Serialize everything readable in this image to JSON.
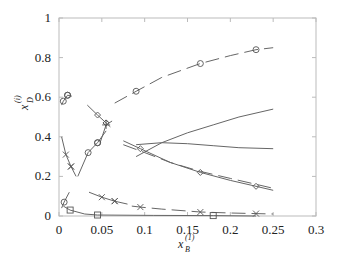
{
  "chart_data": {
    "type": "line",
    "title": "",
    "xlabel": "x_B^(1)",
    "ylabel": "x_D^(i)",
    "xlim": [
      0,
      0.3
    ],
    "ylim": [
      0,
      1
    ],
    "grid": false,
    "legend": null,
    "x_ticks": [
      "0",
      "0.05",
      "0.1",
      "0.15",
      "0.2",
      "0.25",
      "0.3"
    ],
    "y_ticks": [
      "0",
      "0.2",
      "0.4",
      "0.6",
      "0.8",
      "1"
    ],
    "series": [
      {
        "name": "circle-dashed-upper",
        "style": "dashed",
        "marker": "circle",
        "x": [
          0.065,
          0.09,
          0.12,
          0.165,
          0.2,
          0.23,
          0.25
        ],
        "y": [
          0.57,
          0.63,
          0.7,
          0.77,
          0.81,
          0.84,
          0.85
        ]
      },
      {
        "name": "circle-solid-topleft",
        "style": "solid",
        "marker": "circle",
        "x": [
          0.003,
          0.005,
          0.01,
          0.015
        ],
        "y": [
          0.56,
          0.58,
          0.61,
          0.605
        ]
      },
      {
        "name": "diamond-solid-upper",
        "style": "solid",
        "marker": "diamond",
        "x": [
          0.033,
          0.045,
          0.055,
          0.06
        ],
        "y": [
          0.56,
          0.51,
          0.47,
          0.45
        ]
      },
      {
        "name": "plus-descending",
        "style": "solid",
        "marker": "plus",
        "x": [
          0.048,
          0.055,
          0.062
        ],
        "y": [
          0.37,
          0.46,
          0.48
        ]
      },
      {
        "name": "x-solid-left",
        "style": "solid",
        "marker": "x",
        "x": [
          0.003,
          0.008,
          0.014,
          0.02
        ],
        "y": [
          0.4,
          0.31,
          0.25,
          0.2
        ]
      },
      {
        "name": "circle-solid-left-rising",
        "style": "solid",
        "marker": "circle",
        "x": [
          0.022,
          0.034,
          0.045,
          0.055
        ],
        "y": [
          0.2,
          0.32,
          0.37,
          0.43
        ]
      },
      {
        "name": "solid-rising-middle",
        "style": "solid",
        "marker": "none",
        "x": [
          0.09,
          0.12,
          0.15,
          0.18,
          0.21,
          0.25
        ],
        "y": [
          0.3,
          0.37,
          0.42,
          0.46,
          0.5,
          0.54
        ]
      },
      {
        "name": "solid-flat-middle",
        "style": "solid",
        "marker": "none",
        "x": [
          0.09,
          0.12,
          0.15,
          0.18,
          0.21,
          0.25
        ],
        "y": [
          0.36,
          0.37,
          0.365,
          0.355,
          0.345,
          0.34
        ]
      },
      {
        "name": "diamond-solid-descending",
        "style": "solid",
        "marker": "diamond",
        "x": [
          0.075,
          0.095,
          0.13,
          0.165,
          0.2,
          0.23,
          0.25
        ],
        "y": [
          0.38,
          0.34,
          0.27,
          0.22,
          0.18,
          0.15,
          0.13
        ]
      },
      {
        "name": "dashed-descending",
        "style": "dashed",
        "marker": "none",
        "x": [
          0.075,
          0.1,
          0.13,
          0.165,
          0.2,
          0.23,
          0.25
        ],
        "y": [
          0.36,
          0.32,
          0.27,
          0.225,
          0.19,
          0.16,
          0.14
        ]
      },
      {
        "name": "circle-solid-lowleft",
        "style": "solid",
        "marker": "circle",
        "x": [
          0.003,
          0.006,
          0.012
        ],
        "y": [
          0.04,
          0.07,
          0.12
        ]
      },
      {
        "name": "x-solid-lower",
        "style": "solid",
        "marker": "x",
        "x": [
          0.035,
          0.05,
          0.065,
          0.08
        ],
        "y": [
          0.12,
          0.095,
          0.075,
          0.06
        ]
      },
      {
        "name": "x-dashed-bottom",
        "style": "dashed",
        "marker": "x",
        "x": [
          0.085,
          0.095,
          0.12,
          0.165,
          0.2,
          0.23,
          0.25
        ],
        "y": [
          0.05,
          0.045,
          0.035,
          0.02,
          0.015,
          0.012,
          0.01
        ]
      },
      {
        "name": "square-solid-bottom",
        "style": "solid",
        "marker": "square",
        "x": [
          0.005,
          0.013,
          0.03,
          0.045,
          0.11,
          0.18,
          0.23
        ],
        "y": [
          0.05,
          0.03,
          0.01,
          0.005,
          0.003,
          0.002,
          0.0
        ]
      }
    ]
  },
  "axes": {
    "x_label_main": "x",
    "x_label_sub": "B",
    "x_label_sup": "(1)",
    "y_label_main": "x",
    "y_label_sub": "D",
    "y_label_sup": "(i)"
  }
}
